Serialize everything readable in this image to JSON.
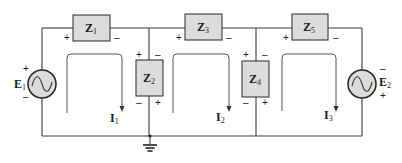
{
  "diagram": {
    "type": "multi-loop AC circuit (mesh analysis)",
    "colors": {
      "wire": "#3a3a3a",
      "component_fill": "#dcdcdc",
      "background": "#ffffff"
    },
    "impedances": [
      {
        "id": "Z1",
        "label": "Z",
        "sub": "1",
        "orientation": "horizontal",
        "plus": "+",
        "minus": "–"
      },
      {
        "id": "Z2",
        "label": "Z",
        "sub": "2",
        "orientation": "vertical",
        "top_left": "+",
        "top_right": "–",
        "bottom_left": "–",
        "bottom_right": "+"
      },
      {
        "id": "Z3",
        "label": "Z",
        "sub": "3",
        "orientation": "horizontal",
        "plus": "+",
        "minus": "–"
      },
      {
        "id": "Z4",
        "label": "Z",
        "sub": "4",
        "orientation": "vertical",
        "top_left": "+",
        "top_right": "–",
        "bottom_left": "–",
        "bottom_right": "+"
      },
      {
        "id": "Z5",
        "label": "Z",
        "sub": "5",
        "orientation": "horizontal",
        "plus": "+",
        "minus": "–"
      }
    ],
    "sources": [
      {
        "id": "E1",
        "label": "E",
        "sub": "1",
        "top": "+",
        "bottom": "–",
        "symbol": "sine-wave-icon"
      },
      {
        "id": "E2",
        "label": "E",
        "sub": "2",
        "top": "–",
        "bottom": "+",
        "symbol": "sine-wave-icon"
      }
    ],
    "mesh_currents": [
      {
        "id": "I1",
        "label": "I",
        "sub": "1",
        "direction": "clockwise"
      },
      {
        "id": "I2",
        "label": "I",
        "sub": "2",
        "direction": "clockwise"
      },
      {
        "id": "I3",
        "label": "I",
        "sub": "3",
        "direction": "clockwise"
      }
    ],
    "ground": {
      "symbol": "ground-icon",
      "node": "bottom rail below Z2"
    }
  }
}
